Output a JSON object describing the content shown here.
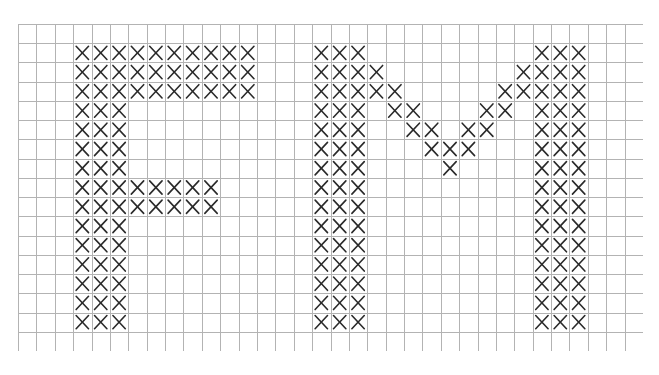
{
  "pattern": {
    "title": "FM",
    "columns": 34,
    "rows": 17,
    "grid_color": "#b3b3b3",
    "stitch_color": "#2a2a2a",
    "background_color": "#ffffff",
    "stitch_symbol": "×",
    "letters": [
      {
        "letter": "F",
        "rows": {
          "1": [
            [
              3,
              12
            ]
          ],
          "2": [
            [
              3,
              12
            ]
          ],
          "3": [
            [
              3,
              12
            ]
          ],
          "4": [
            [
              3,
              5
            ]
          ],
          "5": [
            [
              3,
              5
            ]
          ],
          "6": [
            [
              3,
              5
            ]
          ],
          "7": [
            [
              3,
              5
            ]
          ],
          "8": [
            [
              3,
              10
            ]
          ],
          "9": [
            [
              3,
              10
            ]
          ],
          "10": [
            [
              3,
              5
            ]
          ],
          "11": [
            [
              3,
              5
            ]
          ],
          "12": [
            [
              3,
              5
            ]
          ],
          "13": [
            [
              3,
              5
            ]
          ],
          "14": [
            [
              3,
              5
            ]
          ],
          "15": [
            [
              3,
              5
            ]
          ]
        }
      },
      {
        "letter": "M",
        "rows": {
          "1": [
            [
              16,
              18
            ],
            [
              28,
              30
            ]
          ],
          "2": [
            [
              16,
              19
            ],
            [
              27,
              30
            ]
          ],
          "3": [
            [
              16,
              20
            ],
            [
              26,
              30
            ]
          ],
          "4": [
            [
              16,
              18
            ],
            [
              20,
              21
            ],
            [
              25,
              26
            ],
            [
              28,
              30
            ]
          ],
          "5": [
            [
              16,
              18
            ],
            [
              21,
              22
            ],
            [
              24,
              25
            ],
            [
              28,
              30
            ]
          ],
          "6": [
            [
              16,
              18
            ],
            [
              22,
              24
            ],
            [
              28,
              30
            ]
          ],
          "7": [
            [
              16,
              18
            ],
            [
              23,
              23
            ],
            [
              28,
              30
            ]
          ],
          "8": [
            [
              16,
              18
            ],
            [
              28,
              30
            ]
          ],
          "9": [
            [
              16,
              18
            ],
            [
              28,
              30
            ]
          ],
          "10": [
            [
              16,
              18
            ],
            [
              28,
              30
            ]
          ],
          "11": [
            [
              16,
              18
            ],
            [
              28,
              30
            ]
          ],
          "12": [
            [
              16,
              18
            ],
            [
              28,
              30
            ]
          ],
          "13": [
            [
              16,
              18
            ],
            [
              28,
              30
            ]
          ],
          "14": [
            [
              16,
              18
            ],
            [
              28,
              30
            ]
          ],
          "15": [
            [
              16,
              18
            ],
            [
              28,
              30
            ]
          ]
        }
      }
    ]
  }
}
